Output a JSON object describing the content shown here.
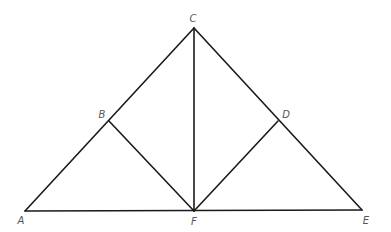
{
  "diagram": {
    "type": "geometry-figure",
    "points": {
      "A": {
        "label": "A",
        "x": 25,
        "y": 211,
        "lx": 21,
        "ly": 221
      },
      "B": {
        "label": "B",
        "x": 109,
        "y": 121,
        "lx": 102,
        "ly": 115
      },
      "C": {
        "label": "C",
        "x": 194,
        "y": 28,
        "lx": 193,
        "ly": 19
      },
      "D": {
        "label": "D",
        "x": 278,
        "y": 121,
        "lx": 286,
        "ly": 115
      },
      "E": {
        "label": "E",
        "x": 362,
        "y": 210,
        "lx": 366,
        "ly": 221
      },
      "F": {
        "label": "F",
        "x": 194,
        "y": 211,
        "lx": 194,
        "ly": 222
      }
    },
    "segments": [
      {
        "name": "segment-AC",
        "from": "A",
        "to": "C"
      },
      {
        "name": "segment-CE",
        "from": "C",
        "to": "E"
      },
      {
        "name": "segment-AE",
        "from": "A",
        "to": "E"
      },
      {
        "name": "segment-CF",
        "from": "C",
        "to": "F"
      },
      {
        "name": "segment-BF",
        "from": "B",
        "to": "F"
      },
      {
        "name": "segment-DF",
        "from": "D",
        "to": "F"
      }
    ],
    "colors": {
      "line": "#1a1a1a",
      "label": "#555555",
      "background": "#ffffff"
    }
  }
}
